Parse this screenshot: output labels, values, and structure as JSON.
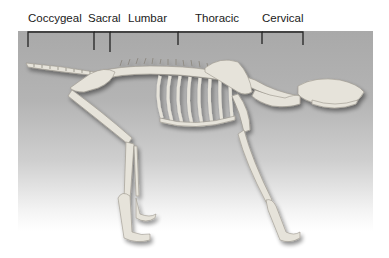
{
  "figure": {
    "regions": [
      {
        "label": "Coccygeal",
        "x": 28,
        "bracket": [
          28,
          94
        ]
      },
      {
        "label": "Sacral",
        "x": 88,
        "bracket": [
          94,
          110
        ]
      },
      {
        "label": "Lumbar",
        "x": 128,
        "bracket": [
          110,
          178
        ]
      },
      {
        "label": "Thoracic",
        "x": 195,
        "bracket": [
          178,
          262
        ]
      },
      {
        "label": "Cervical",
        "x": 262,
        "bracket": [
          262,
          303
        ]
      }
    ],
    "colors": {
      "background": "#ffffff",
      "panel_top": "#a9a9a9",
      "bone": "#e6e3da",
      "bracket": "#222222"
    }
  }
}
